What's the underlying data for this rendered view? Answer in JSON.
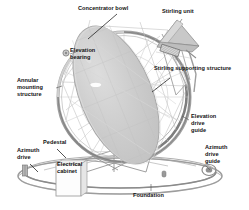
{
  "figure": {
    "background_color": "#ffffff",
    "line_color": "#8c8c8c",
    "dish_fill_color": "#cccccc",
    "ring_color": "#9a9a9a",
    "text_color": "#121212"
  },
  "labels": {
    "concentrator_bowl": "Concentrator bowl",
    "stirling_unit": "Stirling unit",
    "elevation_bearing": "Elevation\nbearing",
    "stirling_supporting_structure": "Stirling supporting structure",
    "annular_mounting_structure": "Annular\nmounting\nstructure",
    "elevation_drive_guide": "Elevation\ndrive\nguide",
    "azimuth_drive_guide": "Azimuth\ndrive\nguide",
    "pedestal": "Pedestal",
    "azimuth_drive": "Azimuth\ndrive",
    "electrical_cabinet": "Electrical\ncabinet",
    "foundation": "Foundation"
  },
  "components": [
    {
      "name": "concentrator-bowl",
      "description": "Large elliptical parabolic dish reflector"
    },
    {
      "name": "stirling-unit",
      "description": "Receiver and Stirling engine at focal point"
    },
    {
      "name": "elevation-bearing",
      "description": "Pivot bearing on annular ring"
    },
    {
      "name": "stirling-supporting-structure",
      "description": "Truss arms holding the Stirling unit"
    },
    {
      "name": "annular-mounting-structure",
      "description": "Large circular ring frame"
    },
    {
      "name": "elevation-drive-guide",
      "description": "Curved guide rail on ring right side"
    },
    {
      "name": "azimuth-drive-guide",
      "description": "Circular base track at right"
    },
    {
      "name": "pedestal",
      "description": "Central vertical support post"
    },
    {
      "name": "azimuth-drive",
      "description": "Drive unit on base ring at left"
    },
    {
      "name": "electrical-cabinet",
      "description": "Rectangular cabinet at base left"
    },
    {
      "name": "foundation",
      "description": "Ground ring foundation slab"
    }
  ]
}
